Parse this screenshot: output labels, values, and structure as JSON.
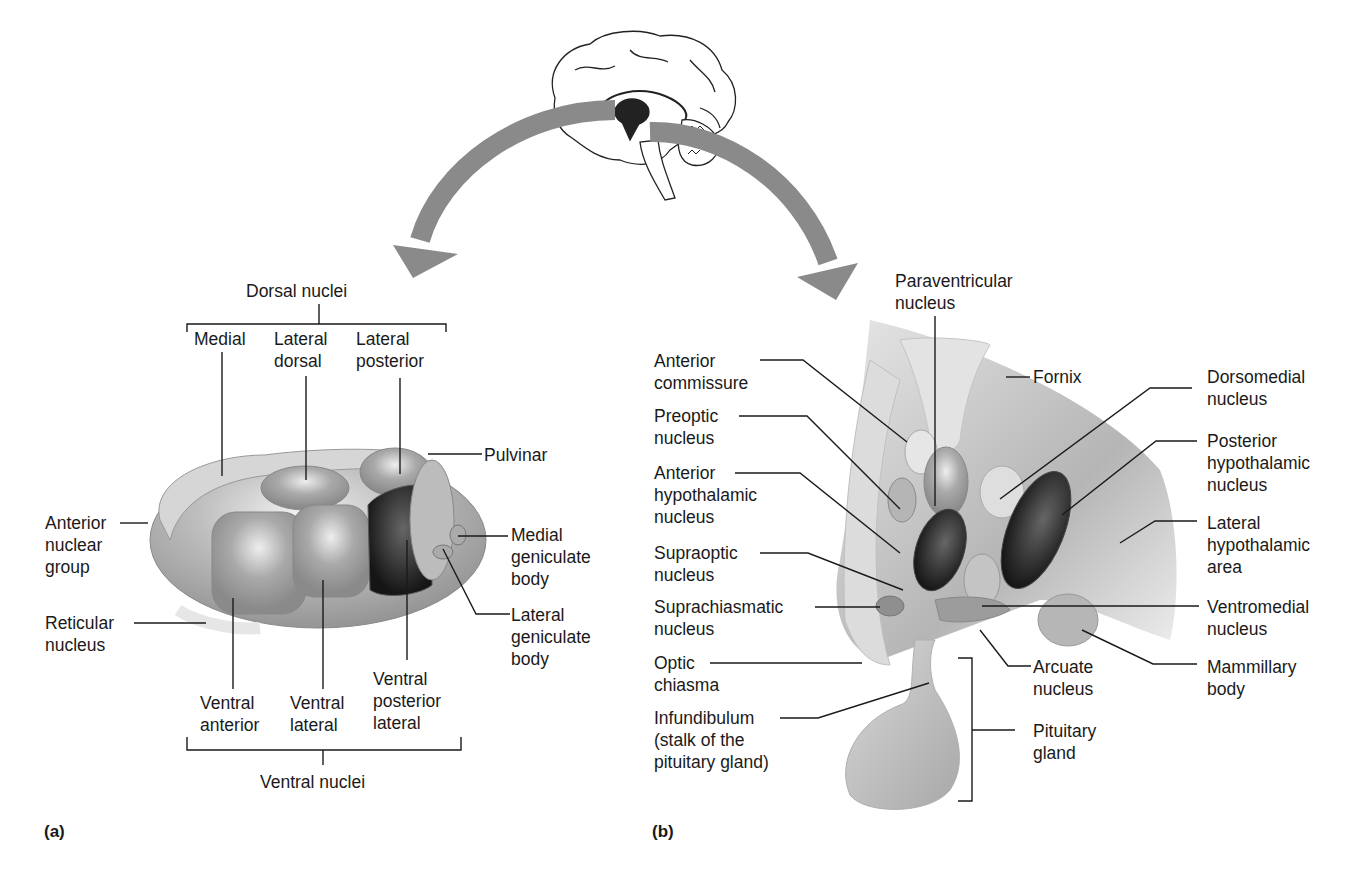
{
  "figure": {
    "panels": [
      {
        "id": "a",
        "tag": "(a)",
        "subject": "Thalamus (nuclei)"
      },
      {
        "id": "b",
        "tag": "(b)",
        "subject": "Hypothalamus (nuclei) and pituitary gland"
      }
    ],
    "colors": {
      "arrow": "#808080",
      "structure_light": "#d0d0d0",
      "structure_mid": "#a8a8a8",
      "structure_dark": "#2a2a2a",
      "leader_line": "#1a1a1a",
      "background": "#ffffff"
    }
  },
  "panel_a": {
    "dorsal_group": "Dorsal nuclei",
    "ventral_group": "Ventral nuclei",
    "labels": {
      "medial": "Medial",
      "lateral_dorsal": "Lateral\ndorsal",
      "lateral_posterior": "Lateral\nposterior",
      "pulvinar": "Pulvinar",
      "anterior_nuclear_group": "Anterior\nnuclear\ngroup",
      "reticular_nucleus": "Reticular\nnucleus",
      "medial_geniculate_body": "Medial\ngeniculate\nbody",
      "lateral_geniculate_body": "Lateral\ngeniculate\nbody",
      "ventral_anterior": "Ventral\nanterior",
      "ventral_lateral": "Ventral\nlateral",
      "ventral_posterior_lateral": "Ventral\nposterior\nlateral"
    }
  },
  "panel_b": {
    "labels": {
      "paraventricular_nucleus": "Paraventricular\nnucleus",
      "anterior_commissure": "Anterior\ncommissure",
      "preoptic_nucleus": "Preoptic\nnucleus",
      "anterior_hypothalamic_nucleus": "Anterior\nhypothalamic\nnucleus",
      "supraoptic_nucleus": "Supraoptic\nnucleus",
      "suprachiasmatic_nucleus": "Suprachiasmatic\nnucleus",
      "optic_chiasma": "Optic\nchiasma",
      "infundibulum": "Infundibulum\n(stalk of the\npituitary gland)",
      "fornix": "Fornix",
      "dorsomedial_nucleus": "Dorsomedial\nnucleus",
      "posterior_hypothalamic_nucleus": "Posterior\nhypothalamic\nnucleus",
      "lateral_hypothalamic_area": "Lateral\nhypothalamic\narea",
      "ventromedial_nucleus": "Ventromedial\nnucleus",
      "mammillary_body": "Mammillary\nbody",
      "arcuate_nucleus": "Arcuate\nnucleus",
      "pituitary_gland": "Pituitary\ngland"
    }
  }
}
